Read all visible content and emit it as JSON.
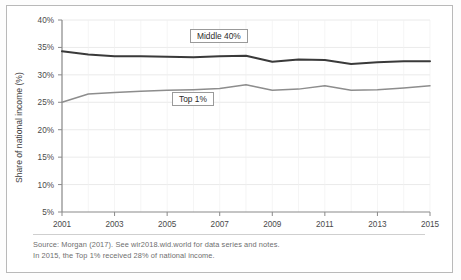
{
  "chart_data": {
    "type": "line",
    "title": "",
    "xlabel": "",
    "ylabel": "Share of national income (%)",
    "x": [
      2001,
      2002,
      2003,
      2004,
      2005,
      2006,
      2007,
      2008,
      2009,
      2010,
      2011,
      2012,
      2013,
      2014,
      2015
    ],
    "xlim": [
      2001,
      2015
    ],
    "ylim": [
      5,
      40
    ],
    "xticks": [
      2001,
      2003,
      2005,
      2007,
      2009,
      2011,
      2013,
      2015
    ],
    "xtick_labels": [
      "2001",
      "2003",
      "2005",
      "2007",
      "2009",
      "2011",
      "2013",
      "2015"
    ],
    "yticks": [
      5,
      10,
      15,
      20,
      25,
      30,
      35,
      40
    ],
    "ytick_labels": [
      "5%",
      "10%",
      "15%",
      "20%",
      "25%",
      "30%",
      "35%",
      "40%"
    ],
    "grid": true,
    "legend_position": "inline-annotation",
    "series": [
      {
        "name": "Middle 40%",
        "color": "#3a3a3a",
        "width": 2.0,
        "values": [
          34.3,
          33.7,
          33.4,
          33.4,
          33.3,
          33.2,
          33.4,
          33.5,
          32.4,
          32.8,
          32.7,
          32.0,
          32.3,
          32.5,
          32.5
        ]
      },
      {
        "name": "Top 1%",
        "color": "#8d8d8d",
        "width": 1.5,
        "values": [
          25.0,
          26.5,
          26.8,
          27.0,
          27.2,
          27.3,
          27.5,
          28.2,
          27.2,
          27.4,
          28.0,
          27.2,
          27.3,
          27.6,
          28.0
        ]
      }
    ],
    "annotations": [
      {
        "name": "Middle 40%",
        "text": "Middle 40%"
      },
      {
        "name": "Top 1%",
        "text": "Top 1%"
      }
    ]
  },
  "notes": {
    "line1": "Source:  Morgan (2017). See wir2018.wid.world for data series and notes.",
    "line2": "In 2015, the Top 1% received 28% of national income."
  },
  "axis": {
    "y_title": "Share of national income (%)"
  }
}
